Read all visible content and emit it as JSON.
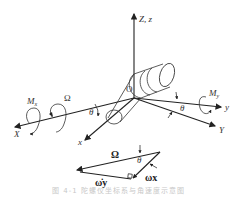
{
  "figure": {
    "axes": {
      "z": "Z, z",
      "X": "X",
      "x": "x",
      "y": "y",
      "Y": "Y",
      "origin": "O"
    },
    "moments": {
      "mx": "Mx",
      "my": "My"
    },
    "rotation": {
      "omega_big": "Ω",
      "theta_left": "θ",
      "theta_right": "θ"
    },
    "vector_triangle": {
      "omega_big": "Ω",
      "theta": "θ",
      "omega_x": "ωx",
      "omega_y": "ω̇y"
    },
    "caption": "图 4-1  陀螺仪坐标系与角速度示意图"
  }
}
